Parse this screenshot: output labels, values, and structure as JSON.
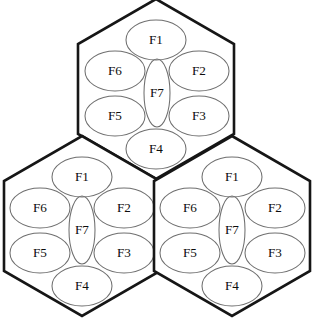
{
  "diagram": {
    "colors": {
      "background": "#ffffff",
      "hex_stroke": "#161616",
      "ellipse_stroke": "#6f6f6f",
      "label_text": "#0d0d0d"
    },
    "cells": [
      {
        "id": "cell-top",
        "name": "top-hexagon",
        "center": {
          "x": 156,
          "y": 89
        },
        "sectors": [
          {
            "id": "F1",
            "label": "F1",
            "cx": 156,
            "cy": 40,
            "rx": 30,
            "ry": 20
          },
          {
            "id": "F2",
            "label": "F2",
            "cx": 199,
            "cy": 71,
            "rx": 30,
            "ry": 20
          },
          {
            "id": "F3",
            "label": "F3",
            "cx": 199,
            "cy": 116,
            "rx": 30,
            "ry": 20
          },
          {
            "id": "F4",
            "label": "F4",
            "cx": 156,
            "cy": 149,
            "rx": 30,
            "ry": 20
          },
          {
            "id": "F5",
            "label": "F5",
            "cx": 115,
            "cy": 116,
            "rx": 30,
            "ry": 20
          },
          {
            "id": "F6",
            "label": "F6",
            "cx": 115,
            "cy": 71,
            "rx": 30,
            "ry": 20
          },
          {
            "id": "F7",
            "label": "F7",
            "cx": 157,
            "cy": 93,
            "rx": 13,
            "ry": 34
          }
        ]
      },
      {
        "id": "cell-bottom-left",
        "name": "bottom-left-hexagon",
        "center": {
          "x": 82,
          "y": 226
        },
        "sectors": [
          {
            "id": "F1",
            "label": "F1",
            "cx": 82,
            "cy": 177,
            "rx": 30,
            "ry": 20
          },
          {
            "id": "F2",
            "label": "F2",
            "cx": 124,
            "cy": 208,
            "rx": 30,
            "ry": 20
          },
          {
            "id": "F3",
            "label": "F3",
            "cx": 124,
            "cy": 253,
            "rx": 30,
            "ry": 20
          },
          {
            "id": "F4",
            "label": "F4",
            "cx": 82,
            "cy": 286,
            "rx": 30,
            "ry": 20
          },
          {
            "id": "F5",
            "label": "F5",
            "cx": 40,
            "cy": 253,
            "rx": 30,
            "ry": 20
          },
          {
            "id": "F6",
            "label": "F6",
            "cx": 40,
            "cy": 208,
            "rx": 30,
            "ry": 20
          },
          {
            "id": "F7",
            "label": "F7",
            "cx": 82,
            "cy": 230,
            "rx": 13,
            "ry": 34
          }
        ]
      },
      {
        "id": "cell-bottom-right",
        "name": "bottom-right-hexagon",
        "center": {
          "x": 232,
          "y": 226
        },
        "sectors": [
          {
            "id": "F1",
            "label": "F1",
            "cx": 232,
            "cy": 177,
            "rx": 30,
            "ry": 20
          },
          {
            "id": "F2",
            "label": "F2",
            "cx": 275,
            "cy": 208,
            "rx": 30,
            "ry": 20
          },
          {
            "id": "F3",
            "label": "F3",
            "cx": 275,
            "cy": 253,
            "rx": 30,
            "ry": 20
          },
          {
            "id": "F4",
            "label": "F4",
            "cx": 232,
            "cy": 286,
            "rx": 30,
            "ry": 20
          },
          {
            "id": "F5",
            "label": "F5",
            "cx": 190,
            "cy": 253,
            "rx": 30,
            "ry": 20
          },
          {
            "id": "F6",
            "label": "F6",
            "cx": 190,
            "cy": 208,
            "rx": 30,
            "ry": 20
          },
          {
            "id": "F7",
            "label": "F7",
            "cx": 232,
            "cy": 230,
            "rx": 13,
            "ry": 34
          }
        ]
      }
    ],
    "hex_geometry": {
      "radius": 90,
      "flat_half_width": 78,
      "vertical_side_half": 45
    }
  }
}
